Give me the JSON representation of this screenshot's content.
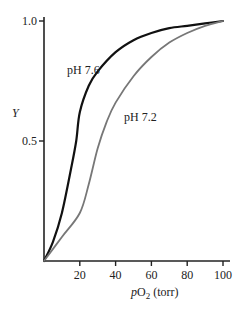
{
  "chart_data": {
    "type": "line",
    "title": "",
    "xlabel": "pO2 (torr)",
    "xlabel_parts": {
      "italic": "p",
      "main": "O",
      "sub": "2",
      "unit": " (torr)"
    },
    "ylabel": "Y",
    "xlim": [
      0,
      100
    ],
    "ylim": [
      0,
      1.0
    ],
    "x_ticks": [
      20,
      40,
      60,
      80,
      100
    ],
    "x_tick_labels": [
      "20",
      "40",
      "60",
      "80",
      "100"
    ],
    "y_ticks": [
      0.5,
      1.0
    ],
    "y_tick_labels": [
      "0.5",
      "1.0"
    ],
    "grid": false,
    "legend": "inline labels",
    "series": [
      {
        "name": "pH 7.6",
        "color": "#111111",
        "x": [
          0,
          5,
          10,
          15,
          18,
          20,
          25,
          30,
          40,
          50,
          60,
          70,
          80,
          90,
          100
        ],
        "y": [
          0,
          0.08,
          0.2,
          0.38,
          0.5,
          0.62,
          0.73,
          0.79,
          0.87,
          0.92,
          0.95,
          0.97,
          0.98,
          0.99,
          1.0
        ]
      },
      {
        "name": "pH 7.2",
        "color": "#777777",
        "x": [
          0,
          10,
          20,
          25,
          30,
          35,
          40,
          50,
          60,
          70,
          80,
          90,
          100
        ],
        "y": [
          0,
          0.1,
          0.2,
          0.32,
          0.47,
          0.58,
          0.66,
          0.77,
          0.85,
          0.91,
          0.95,
          0.98,
          1.0
        ]
      }
    ],
    "annotations": [
      {
        "text": "pH 7.6",
        "near_x": 15,
        "near_y": 0.83
      },
      {
        "text": "pH 7.2",
        "near_x": 52,
        "near_y": 0.6
      }
    ]
  }
}
